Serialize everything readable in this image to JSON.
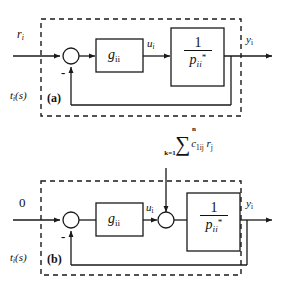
{
  "figure": {
    "stroke_color": "#1a1a1a",
    "text_color": "#111111",
    "background": "#ffffff"
  },
  "panel_a": {
    "caption": "(a)",
    "input_label": "r",
    "input_label_sub": "i",
    "disturbance_label": "t",
    "disturbance_label_sub": "i",
    "disturbance_label_tail": "(s)",
    "sum_sign": "-",
    "controller_block": {
      "label": "g",
      "label_sub": "ii"
    },
    "mid_signal": {
      "label": "u",
      "label_sub": "i"
    },
    "plant_block": {
      "numerator": "1",
      "denominator": "p",
      "denominator_sub": "ii",
      "denominator_sup": "*"
    },
    "output_label": "y",
    "output_label_sub": "i"
  },
  "panel_b": {
    "caption": "(b)",
    "input_label": "0",
    "disturbance_label": "t",
    "disturbance_label_sub": "i",
    "disturbance_label_tail": "(s)",
    "sum_sign": "-",
    "controller_block": {
      "label": "g",
      "label_sub": "ii"
    },
    "mid_signal": {
      "label": "u",
      "label_sub": "i"
    },
    "external_sum": {
      "upper_limit": "n",
      "sigma": "∑",
      "lower_limit": "k=1",
      "term": "c",
      "term_sub": "1ij",
      "term2": "r",
      "term2_sub": "j"
    },
    "plant_block": {
      "numerator": "1",
      "denominator": "p",
      "denominator_sub": "ii",
      "denominator_sup": "*"
    },
    "output_label": "y",
    "output_label_sub": "i"
  }
}
